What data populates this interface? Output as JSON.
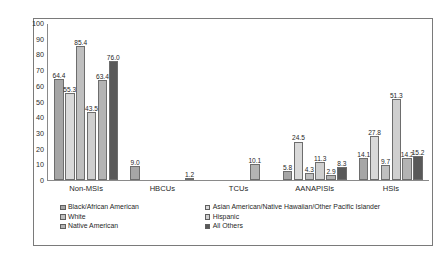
{
  "chart_data": {
    "type": "bar",
    "title": "",
    "xlabel": "",
    "ylabel": "",
    "ylim": [
      0,
      100
    ],
    "ytick_step": 10,
    "yticks": [
      "100",
      "90",
      "80",
      "70",
      "60",
      "50",
      "40",
      "30",
      "20",
      "10",
      "0"
    ],
    "grid": false,
    "legend_position": "bottom",
    "categories": [
      "Non-MSIs",
      "HBCUs",
      "TCUs",
      "AANAPISIs",
      "HSIs"
    ],
    "series": [
      {
        "name": "Black/African American",
        "color": "#a6a6a6",
        "values": [
          64.4,
          9.0,
          0.0,
          5.8,
          14.1
        ],
        "labels": [
          "64.4",
          "9.0",
          "",
          "5.8",
          "14.1"
        ]
      },
      {
        "name": "Asian American/Native Hawaiian/Other Pacific Islander",
        "color": "#d9d9d9",
        "values": [
          55.3,
          0.0,
          0.0,
          24.5,
          27.8
        ],
        "labels": [
          "55.3",
          "",
          "",
          "24.5",
          "27.8"
        ]
      },
      {
        "name": "White",
        "color": "#bfbfbf",
        "values": [
          85.4,
          0.0,
          0.0,
          4.3,
          9.7
        ],
        "labels": [
          "85.4",
          "",
          "",
          "4.3",
          "9.7"
        ]
      },
      {
        "name": "Hispanic",
        "color": "#cfcfcf",
        "values": [
          43.5,
          0.0,
          0.0,
          11.3,
          51.3
        ],
        "labels": [
          "43.5",
          "",
          "",
          "11.3",
          "51.3"
        ]
      },
      {
        "name": "Native American",
        "color": "#b3b3b3",
        "values": [
          63.4,
          0.0,
          10.1,
          2.9,
          14.2
        ],
        "labels": [
          "63.4",
          "",
          "10.1",
          "2.9",
          "14.2"
        ]
      },
      {
        "name": "All Others",
        "color": "#595959",
        "values": [
          76.0,
          1.2,
          0.0,
          8.3,
          15.2
        ],
        "labels": [
          "76.0",
          "1.2",
          "",
          "8.3",
          "15.2"
        ]
      }
    ]
  },
  "legend": {
    "left_column": [
      {
        "label": "Black/African American",
        "color": "#a6a6a6"
      },
      {
        "label": "White",
        "color": "#bfbfbf"
      },
      {
        "label": "Native American",
        "color": "#b3b3b3"
      }
    ],
    "right_column": [
      {
        "label": "Asian American/Native Hawaiian/Other Pacific Islander",
        "color": "#d9d9d9"
      },
      {
        "label": "Hispanic",
        "color": "#cfcfcf"
      },
      {
        "label": "All Others",
        "color": "#595959"
      }
    ]
  }
}
